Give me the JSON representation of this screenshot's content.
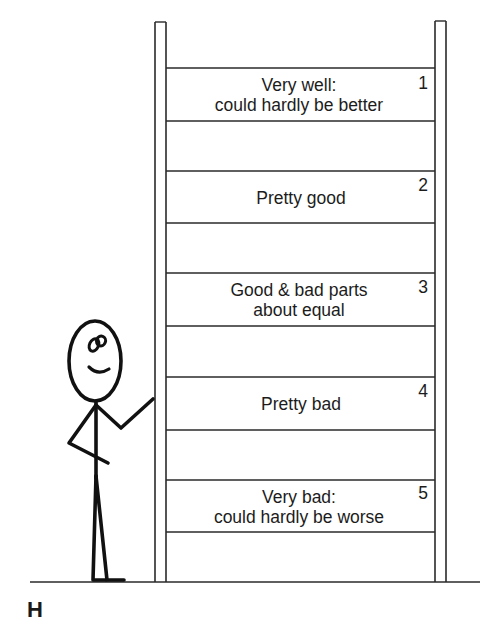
{
  "figure": {
    "panel_label": "H"
  },
  "ladder": {
    "rungs": [
      {
        "number": "1",
        "line1": "Very well:",
        "line2": "could hardly be better"
      },
      {
        "number": "2",
        "line1": "Pretty good",
        "line2": ""
      },
      {
        "number": "3",
        "line1": "Good & bad parts",
        "line2": "about equal"
      },
      {
        "number": "4",
        "line1": "Pretty bad",
        "line2": ""
      },
      {
        "number": "5",
        "line1": "Very bad:",
        "line2": "could hardly be worse"
      }
    ]
  },
  "figure_character": {
    "type": "stick-figure",
    "expression": "smiling",
    "pose": "one hand on hip, other hand raised toward ladder"
  },
  "colors": {
    "line": "#2a2a2a",
    "figure": "#111111",
    "background": "#ffffff"
  }
}
